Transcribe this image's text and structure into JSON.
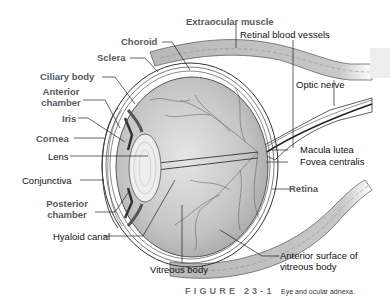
{
  "figure": {
    "number_label": "FIGURE 23-1",
    "title": "Eye and ocular adnexa."
  },
  "labels": {
    "extraocular_muscle": "Extraocular muscle",
    "retinal_blood_vessels": "Retinal blood vessels",
    "choroid": "Choroid",
    "sclera": "Sclera",
    "ciliary_body": "Ciliary body",
    "anterior_chamber_1": "Anterior",
    "anterior_chamber_2": "chamber",
    "iris": "Iris",
    "cornea": "Cornea",
    "lens": "Lens",
    "conjunctiva": "Conjunctiva",
    "posterior_chamber_1": "Posterior",
    "posterior_chamber_2": "chamber",
    "hyaloid_canal": "Hyaloid canal",
    "vitreous_body": "Vitreous body",
    "optic_nerve": "Optic nerve",
    "macula_lutea": "Macula lutea",
    "fovea_centralis": "Fovea centralis",
    "retina": "Retina",
    "anterior_surface_1": "Anterior surface of",
    "anterior_surface_2": "vitreous body"
  },
  "colors": {
    "bold_label": "#555a60",
    "plain_label": "#111111",
    "globe_fill": "#c8c8c8",
    "muscle_fill": "#b4b4b4"
  }
}
